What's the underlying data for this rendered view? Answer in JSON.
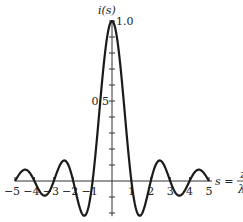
{
  "chart_data": {
    "type": "line",
    "title": "",
    "function": "i(s) = sin(pi s)/(pi s)",
    "ylabel": "i(s)",
    "xlabel": "s = z/λ",
    "xlabel_parts": {
      "lhs": "s =",
      "num": "z",
      "den": "λ"
    },
    "xlim": [
      -5,
      5
    ],
    "ylim": [
      -0.217,
      1.0
    ],
    "x_ticks": [
      -5,
      -4,
      -3,
      -2,
      -1,
      1,
      2,
      3,
      4,
      5
    ],
    "x_tick_labels": [
      "−5",
      "−4",
      "−3",
      "−2",
      "−1",
      "1",
      "2",
      "3",
      "4",
      "5"
    ],
    "y_ticks": [
      -0.2,
      -0.1,
      0.1,
      0.2,
      0.3,
      0.4,
      0.5,
      0.6,
      0.7,
      0.8,
      0.9,
      1.0
    ],
    "y_tick_labels": {
      "0.5": "0.5",
      "1.0": "1.0"
    },
    "grid": false,
    "legend": null,
    "series": [
      {
        "name": "i(s)",
        "x": [
          -5,
          -4.5,
          -4,
          -3.5,
          -3,
          -2.5,
          -2,
          -1.43,
          -1,
          -0.5,
          0,
          0.5,
          1,
          1.43,
          2,
          2.5,
          3,
          3.5,
          4,
          4.5,
          5
        ],
        "values": [
          0,
          0.071,
          0,
          -0.091,
          0,
          0.127,
          0,
          -0.217,
          0,
          0.637,
          1.0,
          0.637,
          0,
          -0.217,
          0,
          0.127,
          0,
          -0.091,
          0,
          0.071,
          0
        ]
      }
    ],
    "stroke_color": "#1a1a1a"
  }
}
